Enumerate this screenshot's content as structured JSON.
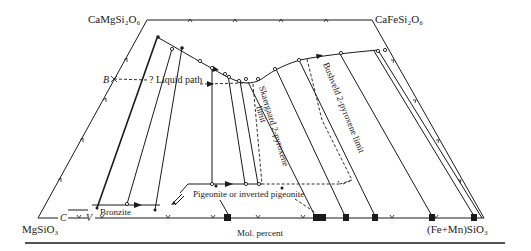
{
  "diagram": {
    "type": "pyroxene quadrilateral",
    "corners": {
      "top_left": "CaMgSi₂O₆",
      "top_right": "CaFeSi₂O₆",
      "bottom_left": "MgSiO₃",
      "bottom_right": "(Fe+Mn)SiO₃"
    },
    "annotations": {
      "point_b": "B",
      "point_c": "C",
      "point_v": "V",
      "liquid_path": "? Liquid path",
      "bronzite": "Bronzite",
      "pigeonite": "Pigeonite or inverted pigeonite",
      "skaergaard_limit_line1": "Skaergaard 2-pyroxene",
      "skaergaard_limit_line2": "limit",
      "bushveld_limit": "Bushveld 2-pyroxene limit",
      "axis_label": "Mol. percent"
    },
    "colors": {
      "ink": "#1a1a1a",
      "background": "#ffffff"
    }
  }
}
